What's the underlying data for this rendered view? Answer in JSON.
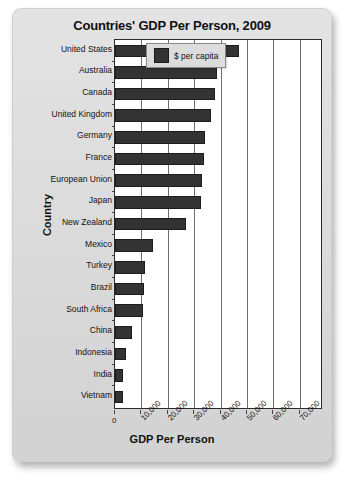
{
  "chart_data": {
    "type": "bar",
    "orientation": "horizontal",
    "title": "Countries' GDP Per Person, 2009",
    "xlabel": "GDP Per Person",
    "ylabel": "Country",
    "xlim": [
      0,
      78000
    ],
    "xticks": [
      0,
      10000,
      20000,
      30000,
      40000,
      50000,
      60000,
      70000
    ],
    "xtick_labels": [
      "0",
      "10,000",
      "20,000",
      "30,000",
      "40,000",
      "50,000",
      "60,000",
      "70,000"
    ],
    "grid": true,
    "legend": {
      "position": "top-right",
      "entries": [
        {
          "label": "$ per capita",
          "color": "#333333"
        }
      ]
    },
    "categories": [
      "United States",
      "Australia",
      "Canada",
      "United Kingdom",
      "Germany",
      "France",
      "European Union",
      "Japan",
      "New Zealand",
      "Mexico",
      "Turkey",
      "Brazil",
      "South Africa",
      "China",
      "Indonesia",
      "India",
      "Vietnam"
    ],
    "values": [
      46800,
      38500,
      38000,
      36500,
      34200,
      33800,
      33000,
      32600,
      27000,
      14500,
      11500,
      10900,
      10500,
      6600,
      4000,
      3100,
      2900
    ],
    "series": [
      {
        "name": "$ per capita",
        "color": "#333333",
        "values": [
          46800,
          38500,
          38000,
          36500,
          34200,
          33800,
          33000,
          32600,
          27000,
          14500,
          11500,
          10900,
          10500,
          6600,
          4000,
          3100,
          2900
        ]
      }
    ]
  }
}
